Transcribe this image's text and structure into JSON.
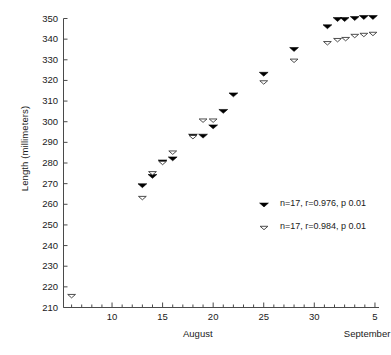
{
  "chart_data": {
    "type": "scatter",
    "title": "",
    "xlabel": "",
    "ylabel": "Length (millimeters)",
    "ylim": [
      210,
      350
    ],
    "xlim": [
      5.2,
      36.4
    ],
    "grid": false,
    "y_ticks": [
      210,
      220,
      230,
      240,
      250,
      260,
      270,
      280,
      290,
      300,
      310,
      320,
      330,
      340,
      350
    ],
    "x_ticks": [
      {
        "x": 10,
        "label": "10"
      },
      {
        "x": 15,
        "label": "15"
      },
      {
        "x": 20,
        "label": "20"
      },
      {
        "x": 25,
        "label": "25"
      },
      {
        "x": 30,
        "label": "30"
      },
      {
        "x": 36,
        "label": "5"
      }
    ],
    "x_minor_ticks": [
      6,
      7,
      8,
      9,
      11,
      12,
      13,
      14,
      16,
      17,
      18,
      19,
      21,
      22,
      23,
      24,
      26,
      27,
      28,
      29,
      31,
      32,
      33,
      34,
      35
    ],
    "month_labels": [
      {
        "text": "August",
        "x": 18.5
      },
      {
        "text": "September",
        "x": 35.2
      }
    ],
    "legend_position": "inside-right-middle",
    "series": [
      {
        "name": "filled-triangle-series",
        "marker": "filled-down-triangle",
        "color": "#000000",
        "legend_label": "n=17, r=0.976, p 0.01",
        "n": 17,
        "r": 0.976,
        "p": "0.01",
        "points": [
          {
            "x": 13,
            "y": 269
          },
          {
            "x": 14,
            "y": 273.5
          },
          {
            "x": 15,
            "y": 280.5
          },
          {
            "x": 16,
            "y": 282
          },
          {
            "x": 18,
            "y": 293
          },
          {
            "x": 19,
            "y": 293
          },
          {
            "x": 20,
            "y": 297.5
          },
          {
            "x": 21,
            "y": 305
          },
          {
            "x": 22,
            "y": 313
          },
          {
            "x": 25,
            "y": 323
          },
          {
            "x": 28,
            "y": 335
          },
          {
            "x": 31.3,
            "y": 346
          },
          {
            "x": 32.3,
            "y": 349.5
          },
          {
            "x": 33,
            "y": 349.5
          },
          {
            "x": 34,
            "y": 350
          },
          {
            "x": 34.9,
            "y": 350.5
          },
          {
            "x": 35.8,
            "y": 350.5
          }
        ]
      },
      {
        "name": "open-triangle-series",
        "marker": "open-down-triangle",
        "color": "#000000",
        "legend_label": "n=17, r=0.984, p 0.01",
        "n": 17,
        "r": 0.984,
        "p": "0.01",
        "points": [
          {
            "x": 6,
            "y": 215.5
          },
          {
            "x": 13,
            "y": 263
          },
          {
            "x": 14,
            "y": 275
          },
          {
            "x": 15,
            "y": 280
          },
          {
            "x": 16,
            "y": 285
          },
          {
            "x": 18,
            "y": 292.5
          },
          {
            "x": 19,
            "y": 300.5
          },
          {
            "x": 20,
            "y": 300.5
          },
          {
            "x": 25,
            "y": 319
          },
          {
            "x": 28,
            "y": 329.5
          },
          {
            "x": 31.3,
            "y": 338
          },
          {
            "x": 32.3,
            "y": 339.5
          },
          {
            "x": 33.1,
            "y": 340
          },
          {
            "x": 34,
            "y": 341.5
          },
          {
            "x": 34.9,
            "y": 342
          },
          {
            "x": 35.8,
            "y": 342.5
          }
        ]
      }
    ]
  }
}
